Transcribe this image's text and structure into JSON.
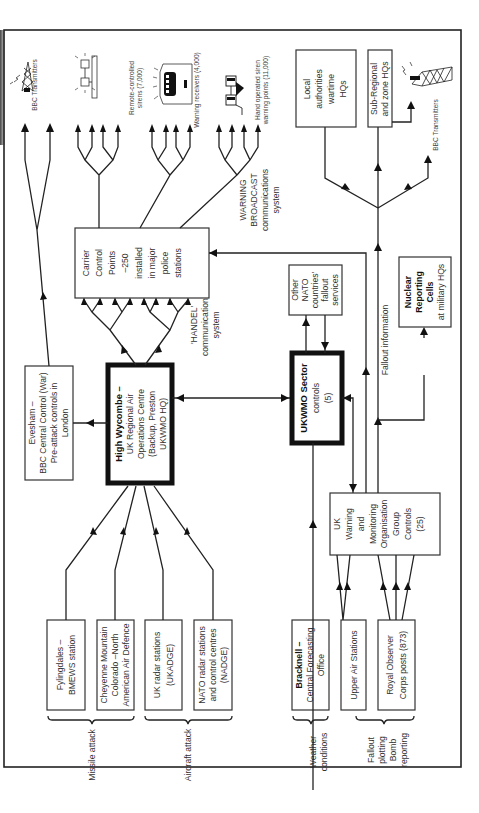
{
  "diagram": {
    "orientation": "rotated -90deg (text reads bottom-to-top)",
    "sources": {
      "missile_attack_label": "Missile attack",
      "aircraft_attack_label": "Aircraft attack",
      "weather_label": [
        "Weather",
        "conditions"
      ],
      "fallout_label": [
        "Fallout",
        "plotting",
        "Bomb",
        "reporting"
      ],
      "fylingdales": [
        "Fylingdales –",
        "BMEWS station"
      ],
      "cheyenne": [
        "Cheyenne Mountain",
        "Colorado –North",
        "American Air Defence"
      ],
      "uk_radar": [
        "UK radar stations",
        "(UKADGE)"
      ],
      "nato_radar": [
        "NATO radar stations",
        "and control centres",
        "(NADGE)"
      ],
      "bracknell": [
        "Bracknell –",
        "Central Forecasting",
        "Office"
      ],
      "upper_air": [
        "Upper Air Stations"
      ],
      "roc_posts": [
        "Royal Observer",
        "Corps posts (873)"
      ]
    },
    "centres": {
      "high_wycombe": [
        "High Wycombe –",
        "UK Regional Air",
        "Operations Centre",
        "(Backup, Preston",
        "UKWMO HQ)"
      ],
      "evesham": [
        "Evesham –",
        "BBC Central Control (War)",
        "Pre-attack controls in",
        "London"
      ],
      "ukwmo_sector": [
        "UKWMO Sector",
        "controls",
        "(5)"
      ],
      "other_nato": [
        "Other",
        "NATO",
        "countries'",
        "fallout",
        "services"
      ],
      "ukwmo_group": [
        "UK",
        "Warning",
        "and",
        "Monitoring",
        "Organisation",
        "Group",
        "Controls",
        "(25)"
      ],
      "carrier_control": [
        "Carrier",
        "Control",
        "Points",
        "–250",
        "installed",
        "in major",
        "police",
        "stations"
      ],
      "nuclear_reporting": [
        "Nuclear",
        "Reporting",
        "Cells",
        "at military HQs"
      ],
      "local_authorities": [
        "Local",
        "authorities",
        "wartime",
        "HQs"
      ],
      "sub_regional": [
        "Sub-Regional",
        "and zone HQs"
      ]
    },
    "systems": {
      "handel": [
        "'HANDEL'",
        "communications",
        "system"
      ],
      "warning_broadcast": [
        "WARNING",
        "BROADCAST",
        "communications",
        "system"
      ],
      "fallout_information": "Fallout information"
    },
    "outputs": {
      "bbc_transmitters_left": "BBC Transmitters",
      "bbc_transmitters_right": "BBC Transmitters",
      "sirens": [
        "Remote-controlled",
        "sirens (7,000)"
      ],
      "warning_receivers": "Warning receivers (4,000)",
      "hand_sirens": [
        "Hand operated siren",
        "warning points (11,000)"
      ]
    }
  }
}
